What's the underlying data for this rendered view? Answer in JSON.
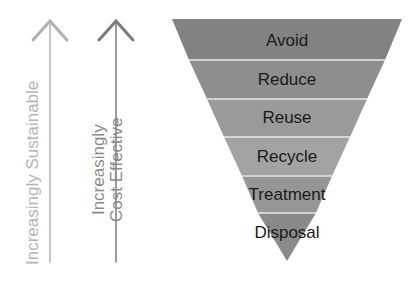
{
  "arrows": {
    "sustainable": {
      "label": "Increasingly Sustainable",
      "color": "#b0b0b0"
    },
    "cost": {
      "line1": "Increasingly",
      "line2": "Cost Effective",
      "color": "#7a7a7a"
    }
  },
  "hierarchy": {
    "tiers": [
      {
        "label": "Avoid",
        "color": "#808080"
      },
      {
        "label": "Reduce",
        "color": "#8c8c8c"
      },
      {
        "label": "Reuse",
        "color": "#989898"
      },
      {
        "label": "Recycle",
        "color": "#a2a2a2"
      },
      {
        "label": "Treatment",
        "color": "#959595"
      },
      {
        "label": "Disposal",
        "color": "#8a8a8a"
      }
    ],
    "separator_color": "#e6e6e6"
  }
}
